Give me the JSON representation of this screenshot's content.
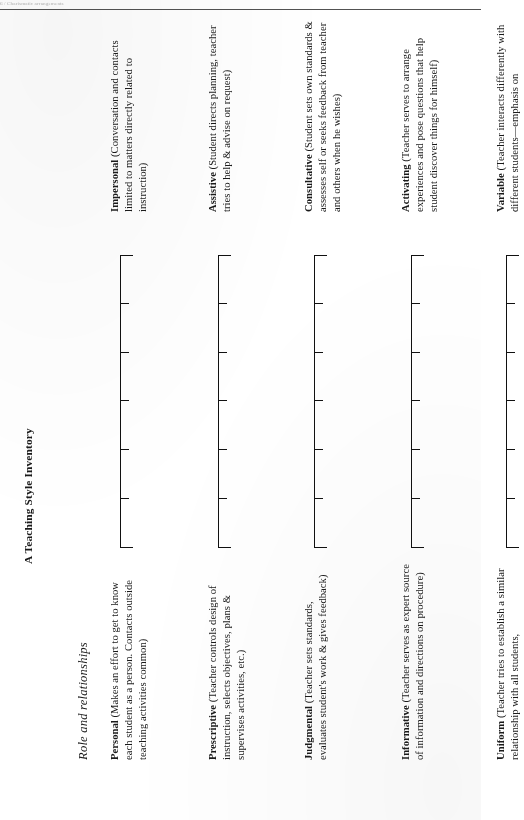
{
  "page": {
    "running_header": "6 / Charismatic arrangements",
    "running_header_legible": false,
    "background_color": "#ffffff",
    "ink_color": "#1a1a1a",
    "orientation": "rotated-90-ccw"
  },
  "document": {
    "title": "A Teaching Style Inventory",
    "section_title": "Role and relationships"
  },
  "scale": {
    "tick_count": 5,
    "has_end_caps": true,
    "description": "Unlabeled bipolar rating line with five interior tick marks"
  },
  "items": [
    {
      "left_term": "Personal",
      "left_gloss": " (Makes an effort to get to know each student as a person. Contacts outside teaching activities common)",
      "right_term": "Impersonal",
      "right_gloss": " (Conversation and contacts limited to matters directly related to instruction)"
    },
    {
      "left_term": "Prescriptive",
      "left_gloss": " (Teacher controls design of instruction, selects objectives, plans & supervises activities, etc.)",
      "right_term": "Assistive",
      "right_gloss": " (Student directs planning, teacher tries to help & advise on request)"
    },
    {
      "left_term": "Judgmental",
      "left_gloss": " (Teacher sets standards, evaluates student's work & gives feedback)",
      "right_term": "Consultative",
      "right_gloss": " (Student sets own standards & assesses self or seeks feedback from teacher and others when he wishes)"
    },
    {
      "left_term": "Informative",
      "left_gloss": " (Teacher serves as expert source of information and directions on procedure)",
      "right_term": "Activating",
      "right_gloss": " (Teacher serves to arrange experiences and pose questions that help student discover things for himself)"
    },
    {
      "left_term": "Uniform",
      "left_gloss": " (Teacher tries to establish a similar relationship with all students,",
      "right_term": "Variable",
      "right_gloss": " (Teacher interacts differently with different students—emphasis on"
    }
  ]
}
